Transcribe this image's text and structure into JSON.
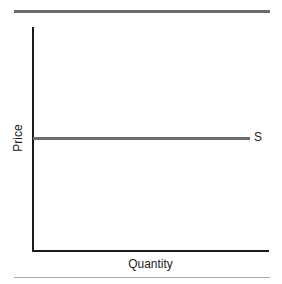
{
  "chart_data": {
    "type": "line",
    "title": "",
    "xlabel": "Quantity",
    "ylabel": "Price",
    "series": [
      {
        "name": "S",
        "description": "Perfectly elastic (horizontal) supply curve",
        "x": [
          0,
          1
        ],
        "y": [
          0.5,
          0.5
        ]
      }
    ],
    "x_ticks": [],
    "y_ticks": [],
    "xlim": [
      0,
      1
    ],
    "ylim": [
      0,
      1
    ],
    "grid": false,
    "legend": "none; series labeled inline at right end of line"
  },
  "labels": {
    "x_axis": "Quantity",
    "y_axis": "Price",
    "series_s": "S"
  },
  "colors": {
    "axis": "#1a1a1a",
    "supply_line": "#6b6b6b",
    "top_rule": "#6d6d6d",
    "bottom_rule": "#a8a8a8"
  }
}
